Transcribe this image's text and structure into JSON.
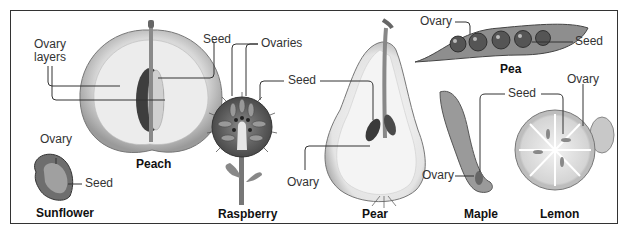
{
  "diagram": {
    "fruits": [
      {
        "name": "Peach",
        "labels": [
          "Ovary layers",
          "Seed"
        ]
      },
      {
        "name": "Sunflower",
        "labels": [
          "Ovary",
          "Seed"
        ]
      },
      {
        "name": "Raspberry",
        "labels": [
          "Ovaries",
          "Seed"
        ]
      },
      {
        "name": "Pear",
        "labels": [
          "Seed",
          "Ovary"
        ]
      },
      {
        "name": "Pea",
        "labels": [
          "Ovary",
          "Seed"
        ]
      },
      {
        "name": "Maple",
        "labels": [
          "Seed",
          "Ovary"
        ]
      },
      {
        "name": "Lemon",
        "labels": [
          "Ovary",
          "Seed"
        ]
      }
    ],
    "text": {
      "peach_ovary_layers_1": "Ovary",
      "peach_ovary_layers_2": "layers",
      "peach_seed": "Seed",
      "peach_name": "Peach",
      "sunflower_ovary": "Ovary",
      "sunflower_seed": "Seed",
      "sunflower_name": "Sunflower",
      "raspberry_ovaries": "Ovaries",
      "raspberry_seed": "Seed",
      "raspberry_name": "Raspberry",
      "pear_ovary": "Ovary",
      "pear_name": "Pear",
      "pea_ovary": "Ovary",
      "pea_seed": "Seed",
      "pea_name": "Pea",
      "maple_seed": "Seed",
      "maple_ovary": "Ovary",
      "maple_name": "Maple",
      "lemon_ovary": "Ovary",
      "lemon_name": "Lemon"
    }
  }
}
